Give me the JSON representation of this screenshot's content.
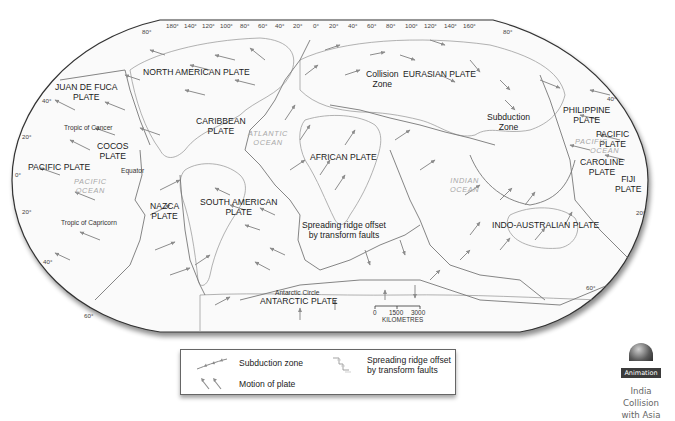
{
  "map": {
    "title": "Tectonic plates of the world",
    "plates": [
      {
        "key": "north_american",
        "label": "NORTH AMERICAN PLATE"
      },
      {
        "key": "juan_de_fuca",
        "label": "JUAN DE FUCA\nPLATE"
      },
      {
        "key": "caribbean",
        "label": "CARIBBEAN\nPLATE"
      },
      {
        "key": "cocos",
        "label": "COCOS\nPLATE"
      },
      {
        "key": "pacific_west",
        "label": "PACIFIC PLATE"
      },
      {
        "key": "nazca",
        "label": "NAZCA\nPLATE"
      },
      {
        "key": "south_american",
        "label": "SOUTH AMERICAN\nPLATE"
      },
      {
        "key": "african",
        "label": "AFRICAN PLATE"
      },
      {
        "key": "eurasian",
        "label": "EURASIAN PLATE"
      },
      {
        "key": "philippine",
        "label": "PHILIPPINE\nPLATE"
      },
      {
        "key": "pacific_east",
        "label": "PACIFIC\nPLATE"
      },
      {
        "key": "caroline",
        "label": "CAROLINE\nPLATE"
      },
      {
        "key": "fiji",
        "label": "FIJI\nPLATE"
      },
      {
        "key": "indo_australian",
        "label": "INDO-AUSTRALIAN PLATE"
      },
      {
        "key": "antarctic",
        "label": "ANTARCTIC PLATE"
      }
    ],
    "oceans": {
      "atlantic": "ATLANTIC\nOCEAN",
      "pacific_west": "PACIFIC\nOCEAN",
      "indian": "INDIAN\nOCEAN",
      "pacific_east_1": "PACIFIC",
      "pacific_east_2": "OCEAN"
    },
    "annotations": {
      "collision_zone": "Collision\nZone",
      "subduction_zone": "Subduction\nZone",
      "spreading_ridge": "Spreading ridge offset\nby transform faults",
      "tropic_cancer": "Tropic of Cancer",
      "tropic_capricorn": "Tropic of Capricorn",
      "equator": "Equator",
      "antarctic_circle": "Antarctic Circle"
    },
    "longitude_labels": [
      "180°",
      "140°",
      "120°",
      "100°",
      "80°",
      "60°",
      "40°",
      "20°",
      "0°",
      "20°",
      "40°",
      "60°",
      "80°",
      "100°",
      "120°",
      "140°",
      "160°"
    ],
    "latitude_labels": {
      "left": [
        "80°",
        "40°",
        "20°",
        "0°",
        "20°",
        "40°",
        "60°"
      ],
      "right": [
        "80°",
        "40°",
        "20°",
        "60°"
      ]
    },
    "scale": {
      "ticks": [
        "0",
        "1500",
        "3000"
      ],
      "unit": "KILOMETRES"
    }
  },
  "legend": {
    "subduction": "Subduction zone",
    "motion": "Motion of plate",
    "spreading": "Spreading ridge offset\nby transform faults"
  },
  "animation": {
    "badge": "Animation",
    "caption_1": "India Collision",
    "caption_2": "with Asia"
  }
}
